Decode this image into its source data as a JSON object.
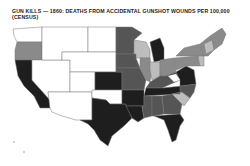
{
  "title": {
    "line1": "GUN KILLS — 1860: DEATHS FROM ACCIDENTAL GUNSHOT WOUNDS PER 100,000",
    "line2": "(CENSUS)"
  },
  "map": {
    "type": "choropleth",
    "region": "United States (1860 territories & states)",
    "legend_visible": false,
    "shades": {
      "none": "#ffffff",
      "light": "#bdbdbd",
      "medium": "#8a8a8a",
      "dark": "#555555",
      "darkest": "#1e1e1e"
    },
    "regions": [
      {
        "name": "Washington Terr.",
        "shade": "none"
      },
      {
        "name": "Oregon",
        "shade": "medium"
      },
      {
        "name": "California",
        "shade": "darkest"
      },
      {
        "name": "Nevada/Utah Terr.",
        "shade": "none"
      },
      {
        "name": "Nebraska/Dakota Terr.",
        "shade": "none"
      },
      {
        "name": "Colorado/New Mexico Terr.",
        "shade": "none"
      },
      {
        "name": "Kansas",
        "shade": "darkest"
      },
      {
        "name": "Indian Terr.",
        "shade": "none"
      },
      {
        "name": "Texas",
        "shade": "darkest"
      },
      {
        "name": "Minnesota",
        "shade": "dark"
      },
      {
        "name": "Wisconsin",
        "shade": "light"
      },
      {
        "name": "Michigan",
        "shade": "darkest"
      },
      {
        "name": "Iowa",
        "shade": "dark"
      },
      {
        "name": "Missouri",
        "shade": "dark"
      },
      {
        "name": "Illinois",
        "shade": "medium"
      },
      {
        "name": "Indiana",
        "shade": "light"
      },
      {
        "name": "Ohio",
        "shade": "medium"
      },
      {
        "name": "Kentucky",
        "shade": "dark"
      },
      {
        "name": "Tennessee",
        "shade": "darkest"
      },
      {
        "name": "Arkansas",
        "shade": "darkest"
      },
      {
        "name": "Louisiana",
        "shade": "darkest"
      },
      {
        "name": "Mississippi",
        "shade": "dark"
      },
      {
        "name": "Alabama",
        "shade": "dark"
      },
      {
        "name": "Georgia",
        "shade": "dark"
      },
      {
        "name": "Florida",
        "shade": "darkest"
      },
      {
        "name": "South Carolina",
        "shade": "light"
      },
      {
        "name": "North Carolina",
        "shade": "dark"
      },
      {
        "name": "Virginia",
        "shade": "darkest"
      },
      {
        "name": "Pennsylvania",
        "shade": "medium"
      },
      {
        "name": "New York",
        "shade": "medium"
      },
      {
        "name": "New England",
        "shade": "medium"
      }
    ]
  }
}
